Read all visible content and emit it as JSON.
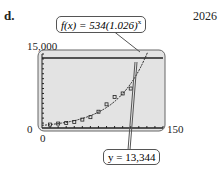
{
  "labels": {
    "part": "d.",
    "answer": "2026",
    "func": "f(x) = 534(1.026)^x",
    "func_text": "f(x) = 534(1.026)",
    "func_exp": "x",
    "yline": "y = 13,344"
  },
  "chart_data": {
    "type": "scatter",
    "title": "",
    "xlabel": "",
    "ylabel": "",
    "xlim": [
      0,
      150
    ],
    "ylim": [
      0,
      15000
    ],
    "window_labels": {
      "xmin": "0",
      "xmax": "150",
      "ymin": "0",
      "ymax": "15,000"
    },
    "series": [
      {
        "name": "data points",
        "kind": "scatter",
        "x": [
          10,
          20,
          30,
          40,
          50,
          60,
          70,
          80,
          90,
          100,
          110
        ],
        "y": [
          700,
          900,
          1000,
          1200,
          1700,
          2200,
          3300,
          4800,
          6300,
          7000,
          8000
        ]
      },
      {
        "name": "f(x) = 534(1.026)^x",
        "kind": "line",
        "model": "534*1.026^x"
      },
      {
        "name": "y = 13,344",
        "kind": "hline",
        "value": 13344
      }
    ],
    "annotations": [
      "f(x) = 534(1.026)^x",
      "y = 13,344",
      "2026"
    ]
  }
}
